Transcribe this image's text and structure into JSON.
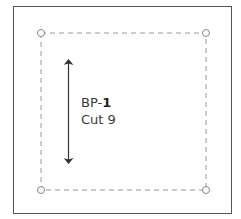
{
  "pattern_piece": {
    "code_prefix": "BP-",
    "code_number": "1",
    "cut_label": "Cut 9"
  },
  "colors": {
    "frame": "#555555",
    "dashed_line": "#9a9a9a",
    "arrow": "#333333",
    "text": "#3a3a3a"
  }
}
